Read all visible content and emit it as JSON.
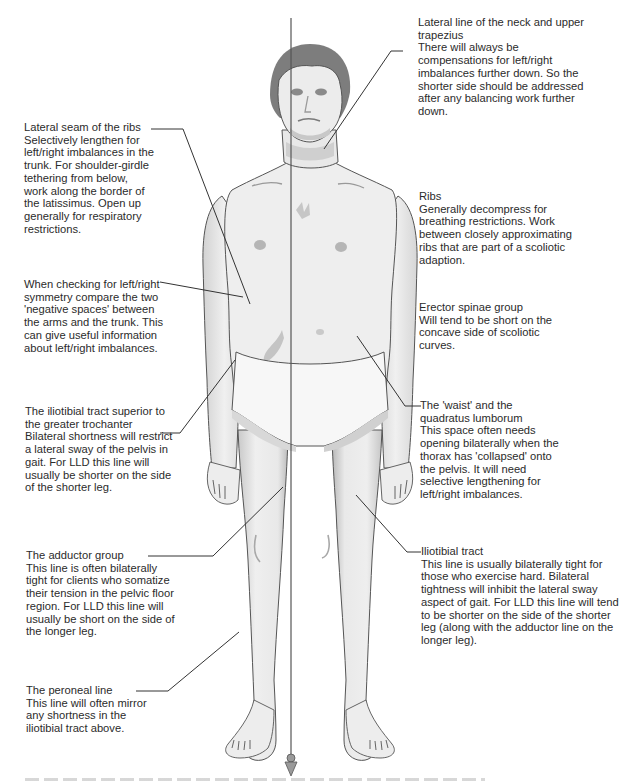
{
  "diagram": {
    "type": "anatomical-annotation",
    "colors": {
      "skin": "#eeeeee",
      "shading": "#bdbdbd",
      "hair": "#7a7a7a",
      "line": "#333333",
      "text": "#2b2b2b"
    }
  },
  "annotations": [
    {
      "id": "neck-trapezius",
      "side": "right",
      "title": "Lateral line of the neck and upper trapezius",
      "body": "There will always be compensations for left/right imbalances further down. So the shorter side should be addressed after any balancing work further down."
    },
    {
      "id": "lateral-seam-ribs",
      "side": "left",
      "title": "Lateral seam of the ribs",
      "body": "Selectively lengthen for left/right imbalances in the trunk. For shoulder-girdle tethering from below, work along the border of the latissimus. Open up generally for respiratory restrictions."
    },
    {
      "id": "ribs",
      "side": "right",
      "title": "Ribs",
      "body": "Generally decompress for breathing restrictions. Work between closely approximating ribs that are part of a scoliotic adaption."
    },
    {
      "id": "negative-spaces",
      "side": "left",
      "title": "",
      "body": "When checking for left/right symmetry compare the two 'negative spaces' between the arms and the trunk. This can give useful information about left/right imbalances."
    },
    {
      "id": "erector-spinae",
      "side": "right",
      "title": "Erector spinae group",
      "body": "Will tend to be short on the concave side of scoliotic curves."
    },
    {
      "id": "iliotibial-superior",
      "side": "left",
      "title": "The iliotibial tract superior to the greater trochanter",
      "body": "Bilateral shortness will restrict a lateral sway of the pelvis in gait. For LLD this line will usually be shorter on the side of the shorter leg."
    },
    {
      "id": "waist-quadratus",
      "side": "right",
      "title": "The 'waist' and the quadratus lumborum",
      "body": "This space often needs opening bilaterally when the thorax has 'collapsed' onto the pelvis. It will need selective lengthening for left/right imbalances."
    },
    {
      "id": "adductor-group",
      "side": "left",
      "title": "The adductor group",
      "body": "This line is often bilaterally tight for clients who somatize their tension in the pelvic floor region. For LLD this line will usually be short on the side of the longer leg."
    },
    {
      "id": "iliotibial-tract",
      "side": "right",
      "title": "Iliotibial tract",
      "body": "This line is usually bilaterally tight for those who exercise hard. Bilateral tightness will inhibit the lateral sway aspect of gait. For LLD this line will tend to be shorter on the side of the shorter leg (along with the adductor line on the longer leg)."
    },
    {
      "id": "peroneal-line",
      "side": "left",
      "title": "The peroneal line",
      "body": "This line will often mirror any shortness in the iliotibial tract above."
    }
  ]
}
